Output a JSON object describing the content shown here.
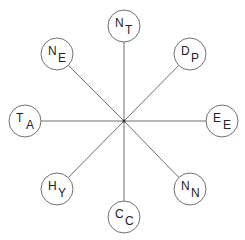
{
  "diagram": {
    "type": "star",
    "center": {
      "x": 124,
      "y": 121
    },
    "node_radius": 16,
    "nodes": [
      {
        "id": "NT",
        "main": "N",
        "sub": "T",
        "x": 124,
        "y": 26
      },
      {
        "id": "DP",
        "main": "D",
        "sub": "P",
        "x": 190,
        "y": 54
      },
      {
        "id": "EE",
        "main": "E",
        "sub": "E",
        "x": 222,
        "y": 121
      },
      {
        "id": "NN",
        "main": "N",
        "sub": "N",
        "x": 190,
        "y": 189
      },
      {
        "id": "CC",
        "main": "C",
        "sub": "C",
        "x": 124,
        "y": 217
      },
      {
        "id": "HY",
        "main": "H",
        "sub": "Y",
        "x": 57,
        "y": 189
      },
      {
        "id": "TA",
        "main": "T",
        "sub": "A",
        "x": 25,
        "y": 121
      },
      {
        "id": "NE",
        "main": "N",
        "sub": "E",
        "x": 57,
        "y": 54
      }
    ],
    "edges": [
      [
        "center",
        "NT"
      ],
      [
        "center",
        "DP"
      ],
      [
        "center",
        "EE"
      ],
      [
        "center",
        "NN"
      ],
      [
        "center",
        "CC"
      ],
      [
        "center",
        "HY"
      ],
      [
        "center",
        "TA"
      ],
      [
        "center",
        "NE"
      ]
    ]
  }
}
